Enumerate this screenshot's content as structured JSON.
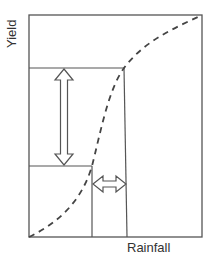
{
  "diagram": {
    "title": "",
    "x_axis_label": "Rainfall",
    "y_axis_label": "Yield",
    "elements": {
      "curve": "dashed sigmoid yield-rainfall response curve",
      "vertical_arrow": "double-headed arrow showing change in yield",
      "horizontal_arrow": "double-headed arrow showing change in rainfall"
    },
    "colors": {
      "line": "#555555",
      "curve": "#444444",
      "arrow_fill": "#ffffff",
      "text": "#333333"
    }
  }
}
